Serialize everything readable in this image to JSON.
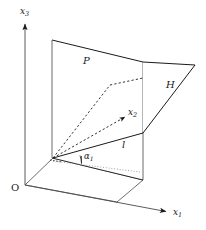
{
  "figure": {
    "type": "geometric-diagram",
    "width": 206,
    "height": 230,
    "background_color": "#ffffff",
    "stroke_color": "#1a1a1a"
  },
  "axes": {
    "x1": {
      "label": "x",
      "subscript": "1"
    },
    "x2": {
      "label": "x",
      "subscript": "2"
    },
    "x3": {
      "label": "x",
      "subscript": "3"
    },
    "origin": {
      "label": "O"
    }
  },
  "planes": {
    "p": {
      "label": "P"
    },
    "h": {
      "label": "H"
    }
  },
  "lines": {
    "l": {
      "label": "l"
    }
  },
  "angles": {
    "alpha1": {
      "label": "α",
      "subscript": "1"
    }
  },
  "geometry": {
    "origin_px": [
      25,
      185
    ],
    "x3_arrow_tip": [
      25,
      22
    ],
    "x1_arrow_tip": [
      168,
      212
    ],
    "x2_arrow_tip": [
      127,
      116
    ],
    "base_point": [
      53,
      158
    ],
    "plane_p_corners": [
      [
        52,
        40
      ],
      [
        143,
        62
      ],
      [
        143,
        180
      ],
      [
        52,
        158
      ]
    ],
    "plane_h_vertices": [
      [
        143,
        62
      ],
      [
        195,
        65
      ],
      [
        143,
        133
      ]
    ],
    "dashed_bend": [
      110,
      85
    ],
    "l_endpoint": [
      143,
      133
    ]
  }
}
